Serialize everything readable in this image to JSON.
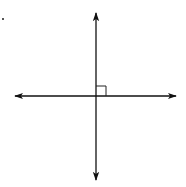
{
  "diagram": {
    "type": "perpendicular-lines",
    "stroke_color": "#111111",
    "background": "#ffffff",
    "intersection": {
      "x": 96,
      "y": 96
    },
    "vertical_line": {
      "x": 96,
      "y1": 13,
      "y2": 180,
      "arrows": "both"
    },
    "horizontal_line": {
      "y": 96,
      "x1": 15,
      "x2": 176,
      "arrows": "both"
    },
    "right_angle_marker": {
      "x": 96,
      "y": 85,
      "size": 10,
      "quadrant": "upper-right"
    },
    "stray_dot": {
      "x": 3,
      "y": 19
    }
  }
}
